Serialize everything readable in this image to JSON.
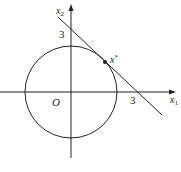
{
  "diagram": {
    "type": "geometry",
    "axes": {
      "x_label": "x",
      "x_sub": "1",
      "y_label": "x",
      "y_sub": "2",
      "origin_label": "O"
    },
    "ticks": {
      "x_intercept_label": "3",
      "y_intercept_label": "3"
    },
    "point": {
      "label": "x",
      "superscript": "*"
    },
    "colors": {
      "stroke": "#222222",
      "background": "#ffffff"
    }
  }
}
